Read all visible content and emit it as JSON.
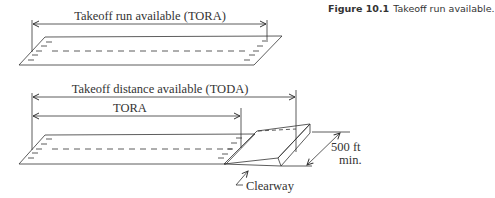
{
  "caption": {
    "number": "Figure 10.1",
    "text": "Takeoff run available."
  },
  "top_diagram": {
    "dimension_label": "Takeoff run available (TORA)"
  },
  "bottom_diagram": {
    "toda_label": "Takeoff distance available (TODA)",
    "tora_label": "TORA",
    "clearway_label": "Clearway",
    "width_label_line1": "500 ft",
    "width_label_line2": "min."
  },
  "colors": {
    "line": "#333333",
    "background": "#ffffff"
  }
}
